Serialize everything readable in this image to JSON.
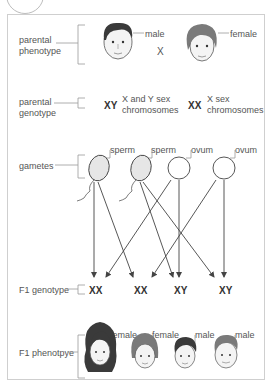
{
  "rows": {
    "parental_phenotype": {
      "label_line1": "parental",
      "label_line2": "phenotype"
    },
    "parental_genotype": {
      "label_line1": "parental",
      "label_line2": "genotype"
    },
    "gametes": {
      "label": "gametes"
    },
    "f1_genotype": {
      "label": "F1 genotype"
    },
    "f1_phenotype": {
      "label": "F1 phenotpye"
    }
  },
  "parents": {
    "male_label": "male",
    "cross_symbol": "X",
    "female_label": "female"
  },
  "parental_genotypes": {
    "male": {
      "symbol": "XY",
      "desc_line1": "X and Y sex",
      "desc_line2": "chromosomes"
    },
    "female": {
      "symbol": "XX",
      "desc_line1": "X sex",
      "desc_line2": "chromosomes"
    }
  },
  "gametes": [
    {
      "type": "sperm",
      "chromosome": "X"
    },
    {
      "type": "sperm",
      "chromosome": "Y"
    },
    {
      "type": "ovum",
      "chromosome": "X"
    },
    {
      "type": "ovum",
      "chromosome": "X"
    }
  ],
  "f1_genotypes": [
    "XX",
    "XX",
    "XY",
    "XY"
  ],
  "f1_phenotypes": [
    "female",
    "female",
    "male",
    "male"
  ],
  "colors": {
    "line": "#444444",
    "sperm_fill": "#e6e6e6",
    "frame": "#cfcfcf",
    "hair_dark": "#3a3a3a",
    "hair_grey": "#7a7a7a",
    "skin": "#f4f4f4"
  }
}
